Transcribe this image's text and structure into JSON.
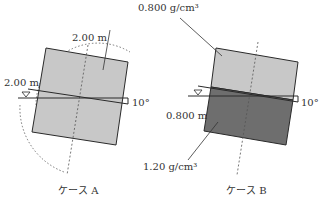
{
  "diagram": {
    "top_density_label": "0.800 g/cm³",
    "bottom_density_label": "1.20 g/cm³",
    "case_a": {
      "caption": "ケース A",
      "width_label": "2.00 m",
      "height_label": "2.00 m",
      "angle_label": "10°"
    },
    "case_b": {
      "caption": "ケース B",
      "depth_label": "0.800 m",
      "angle_label": "10°"
    },
    "colors": {
      "light_fill": "#c8c8c8",
      "dark_fill": "#6e6e6e",
      "stroke": "#2a2a2a"
    }
  }
}
